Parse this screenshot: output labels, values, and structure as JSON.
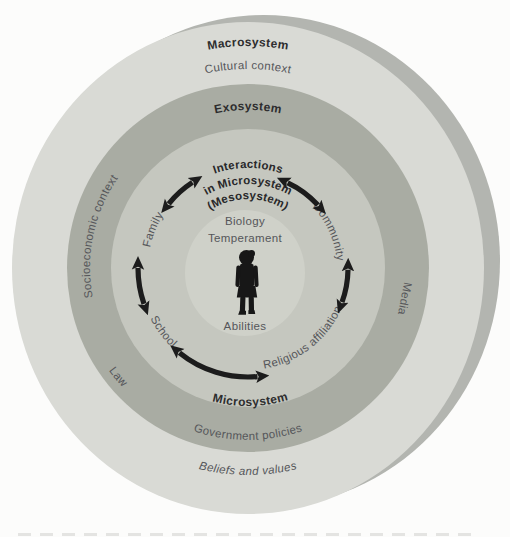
{
  "figure": {
    "colors": {
      "background": "#fcfcfb",
      "macrosystem_ring": "#d9dad5",
      "exosystem_ring": "#a9aca3",
      "microsystem_ring": "#c5c7bf",
      "center_circle": "#cfd1c9",
      "shadow_ring": "#b3b5b0",
      "arrow": "#1c1c1c",
      "bold_text": "#2d2d2e",
      "gray_text": "#55565a"
    },
    "macrosystem": {
      "title": "Macrosystem",
      "subtitle": "Cultural context",
      "bottom": "Beliefs and values"
    },
    "exosystem": {
      "title": "Exosystem",
      "left": "Socioeconomic context",
      "right": "Media",
      "lower_left": "Law",
      "bottom": "Government policies"
    },
    "microsystem": {
      "title": "Microsystem",
      "meso_line1": "Interactions",
      "meso_line2": "in Microsystem",
      "meso_line3": "(Mesosystem)",
      "family": "Family",
      "community": "Community",
      "school": "School",
      "religious": "Religious affiliation"
    },
    "individual": {
      "line1": "Biology",
      "line2": "Temperament",
      "line3": "Abilities"
    }
  }
}
